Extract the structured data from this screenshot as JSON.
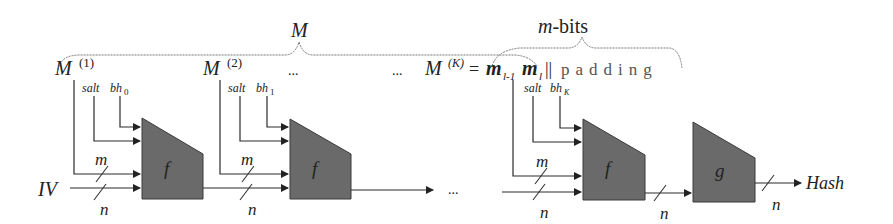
{
  "diagram": {
    "title_top": "M",
    "m_bits_label": "m-bits",
    "blocks": [
      {
        "label": "M",
        "superscript": "(1)",
        "salt": "salt",
        "bh": "bh",
        "bh_sub": "0"
      },
      {
        "label": "M",
        "superscript": "(2)",
        "salt": "salt",
        "bh": "bh",
        "bh_sub": "1"
      },
      {
        "label": "M",
        "superscript": "(K)",
        "salt": "salt",
        "bh": "bh",
        "bh_sub": "K"
      }
    ],
    "ellipsis": "...",
    "last_block_expr": {
      "eq": "=",
      "m_prev": "m",
      "m_prev_sub": "l-1",
      "m_last": "m",
      "m_last_sub": "l",
      "concat": "||",
      "padding": "padding"
    },
    "functions": {
      "compress": "f",
      "final": "g"
    },
    "wire_labels": {
      "m": "m",
      "n": "n"
    },
    "iv_label": "IV",
    "output_label": "Hash",
    "colors": {
      "box_fill": "#6a6a6a",
      "line": "#2a2a2a",
      "brace": "#777777"
    }
  }
}
